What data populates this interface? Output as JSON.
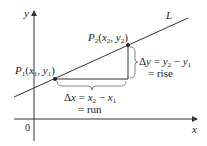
{
  "diagram": {
    "axes": {
      "x_label": "x",
      "y_label": "y",
      "origin_label": "0"
    },
    "line": {
      "label": "L",
      "color": "#333333"
    },
    "points": [
      {
        "name": "P",
        "sub": "1",
        "coords_x": "x",
        "coords_x_sub": "1",
        "coords_y": "y",
        "coords_y_sub": "1"
      },
      {
        "name": "P",
        "sub": "2",
        "coords_x": "x",
        "coords_x_sub": "2",
        "coords_y": "y",
        "coords_y_sub": "2"
      }
    ],
    "rise": {
      "delta": "Δ",
      "var": "y",
      "eq": " = ",
      "a": "y",
      "a_sub": "2",
      "minus": " − ",
      "b": "y",
      "b_sub": "1",
      "word": "= rise"
    },
    "run": {
      "delta": "Δ",
      "var": "x",
      "eq": " = ",
      "a": "x",
      "a_sub": "2",
      "minus": " − ",
      "b": "x",
      "b_sub": "1",
      "word": "= run"
    },
    "colors": {
      "ink": "#222222",
      "axis": "#333333",
      "brace": "#666666",
      "point": "#222222"
    }
  }
}
